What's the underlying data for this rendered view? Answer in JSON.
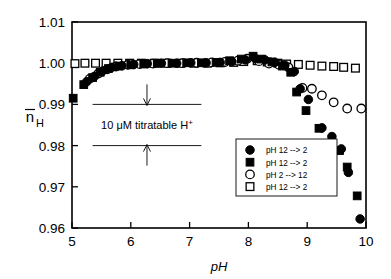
{
  "chart_data": {
    "type": "scatter",
    "title": "",
    "xlabel": "pH",
    "ylabel": "n̄H",
    "xlim": [
      5,
      10
    ],
    "ylim": [
      0.96,
      1.01
    ],
    "xticks": [
      "5",
      "6",
      "7",
      "8",
      "9",
      "10"
    ],
    "yticks": [
      "1.01",
      "1.00",
      "0.99",
      "0.98",
      "0.97",
      "0.96"
    ],
    "grid": false,
    "legend_position": "lower-right",
    "annotations": [
      {
        "text": "10 μM titratable H",
        "superscript": "+",
        "y_top_line": 0.99,
        "y_bottom_line": 0.98,
        "x_start": 5.35,
        "x_end": 7.2
      }
    ],
    "series": [
      {
        "name": "pH 12 --> 2",
        "marker": "filled-circle",
        "points": [
          [
            5.25,
            0.9955
          ],
          [
            5.38,
            0.9968
          ],
          [
            5.52,
            0.9981
          ],
          [
            5.68,
            0.999
          ],
          [
            5.85,
            0.9994
          ],
          [
            6.05,
            0.9997
          ],
          [
            6.28,
            0.9999
          ],
          [
            6.52,
            1.0
          ],
          [
            6.78,
            1.0
          ],
          [
            7.02,
            1.0001
          ],
          [
            7.28,
            1.0001
          ],
          [
            7.52,
            1.0002
          ],
          [
            7.72,
            1.0004
          ],
          [
            7.95,
            1.0008
          ],
          [
            8.12,
            1.0011
          ],
          [
            8.28,
            1.0008
          ],
          [
            8.45,
            1.0002
          ],
          [
            8.62,
            0.9995
          ],
          [
            8.78,
            0.998
          ],
          [
            8.88,
            0.9938
          ],
          [
            9.02,
            0.9912
          ],
          [
            9.25,
            0.9843
          ],
          [
            9.42,
            0.9822
          ],
          [
            9.58,
            0.9792
          ],
          [
            9.7,
            0.9735
          ],
          [
            9.9,
            0.9622
          ]
        ]
      },
      {
        "name": "pH 12 --> 2",
        "marker": "filled-square",
        "points": [
          [
            5.02,
            0.9915
          ],
          [
            5.2,
            0.9948
          ],
          [
            5.35,
            0.9965
          ],
          [
            5.48,
            0.9978
          ],
          [
            5.62,
            0.9987
          ],
          [
            5.8,
            0.9993
          ],
          [
            6.0,
            0.9996
          ],
          [
            6.22,
            0.9998
          ],
          [
            6.45,
            1.0
          ],
          [
            6.7,
            1.0
          ],
          [
            6.95,
            1.0001
          ],
          [
            7.2,
            1.0001
          ],
          [
            7.45,
            1.0002
          ],
          [
            7.68,
            1.0006
          ],
          [
            7.88,
            1.001
          ],
          [
            8.08,
            1.0017
          ],
          [
            8.22,
            1.001
          ],
          [
            8.4,
            1.0003
          ],
          [
            8.58,
            0.9993
          ],
          [
            8.72,
            0.9978
          ],
          [
            8.82,
            0.993
          ],
          [
            8.98,
            0.9885
          ],
          [
            9.2,
            0.9842
          ],
          [
            9.38,
            0.9805
          ],
          [
            9.55,
            0.9788
          ],
          [
            9.68,
            0.9748
          ],
          [
            9.85,
            0.9678
          ]
        ]
      },
      {
        "name": "pH 2 --> 12",
        "marker": "open-circle",
        "points": [
          [
            5.3,
            0.9962
          ],
          [
            5.45,
            0.9975
          ],
          [
            5.6,
            0.9985
          ],
          [
            5.75,
            0.9992
          ],
          [
            5.95,
            0.9996
          ],
          [
            6.15,
            0.9998
          ],
          [
            6.38,
            0.9999
          ],
          [
            6.62,
            1.0
          ],
          [
            6.88,
            1.0
          ],
          [
            7.12,
            1.0001
          ],
          [
            7.38,
            1.0002
          ],
          [
            7.6,
            1.0003
          ],
          [
            7.82,
            1.0006
          ],
          [
            7.98,
            1.0011
          ],
          [
            8.18,
            1.0005
          ],
          [
            8.35,
            0.9999
          ],
          [
            8.52,
            0.9996
          ],
          [
            8.68,
            0.999
          ],
          [
            8.92,
            0.994
          ],
          [
            9.08,
            0.9938
          ],
          [
            9.25,
            0.9922
          ],
          [
            9.45,
            0.9905
          ],
          [
            9.68,
            0.989
          ],
          [
            9.92,
            0.989
          ]
        ]
      },
      {
        "name": "pH 12 --> 2",
        "marker": "open-square",
        "points": [
          [
            5.05,
            0.9999
          ],
          [
            5.22,
            1.0
          ],
          [
            5.4,
            1.0
          ],
          [
            5.58,
            1.0
          ],
          [
            5.78,
            1.0
          ],
          [
            5.98,
            1.0
          ],
          [
            6.18,
            1.0
          ],
          [
            6.4,
            1.0
          ],
          [
            6.62,
            1.0
          ],
          [
            6.85,
            1.0
          ],
          [
            7.08,
            1.0
          ],
          [
            7.3,
            1.0
          ],
          [
            7.52,
            1.0001
          ],
          [
            7.75,
            1.0002
          ],
          [
            7.92,
            1.0004
          ],
          [
            8.15,
            1.0006
          ],
          [
            8.32,
            1.0003
          ],
          [
            8.5,
            1.0
          ],
          [
            8.65,
            0.9998
          ],
          [
            8.85,
            0.9997
          ],
          [
            9.05,
            0.9995
          ],
          [
            9.25,
            0.9993
          ],
          [
            9.45,
            0.9992
          ],
          [
            9.62,
            0.999
          ],
          [
            9.82,
            0.9988
          ]
        ]
      }
    ]
  },
  "legend": {
    "entries": [
      {
        "marker": "filled-circle",
        "label": "pH 12 --> 2"
      },
      {
        "marker": "filled-square",
        "label": "pH 12 --> 2"
      },
      {
        "marker": "open-circle",
        "label": "pH 2 --> 12"
      },
      {
        "marker": "open-square",
        "label": "pH 12 --> 2"
      }
    ]
  },
  "axes": {
    "x_title": "pH",
    "y_title_base": "n",
    "y_title_sub": "H"
  },
  "colors": {
    "foreground": "#000000",
    "background": "#ffffff"
  }
}
